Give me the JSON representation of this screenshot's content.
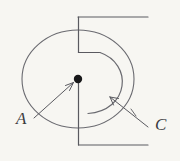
{
  "figure": {
    "kind": "hand-drawn-technical-diagram",
    "background_color": "#f7f6f2",
    "ink_color": "#5a5a60",
    "label_color": "#3b3b3f",
    "width": 180,
    "height": 161
  },
  "labels": [
    {
      "id": "A",
      "text": "A",
      "x": 16,
      "y": 124,
      "points_to": "center-point"
    },
    {
      "id": "C",
      "text": "C",
      "x": 155,
      "y": 130,
      "points_to": "spiral-arc"
    }
  ],
  "geometry": {
    "outer_circle": {
      "cx": 78,
      "cy": 79,
      "rx": 56,
      "ry": 49
    },
    "center_point": {
      "cx": 78,
      "cy": 79,
      "r": 4
    },
    "spiral_arc": {
      "start_x": 101,
      "start_y": 52,
      "end_x": 88,
      "end_y": 113
    },
    "top_lead": {
      "x1": 78,
      "y1": 17,
      "x2": 148,
      "y2": 17
    },
    "top_vertical": {
      "x": 78,
      "y1": 17,
      "y2": 52
    },
    "top_step": {
      "x1": 78,
      "y1": 52,
      "x2": 101,
      "y2": 52
    },
    "bottom_vertical": {
      "x": 78,
      "y1": 79,
      "y2": 145
    },
    "bottom_lead": {
      "x1": 78,
      "y1": 145,
      "x2": 148,
      "y2": 145
    },
    "leader_a": {
      "x1": 36,
      "y1": 117,
      "x2": 74,
      "y2": 82
    },
    "leader_c": {
      "x1": 148,
      "y1": 126,
      "x2": 110,
      "y2": 97
    }
  }
}
